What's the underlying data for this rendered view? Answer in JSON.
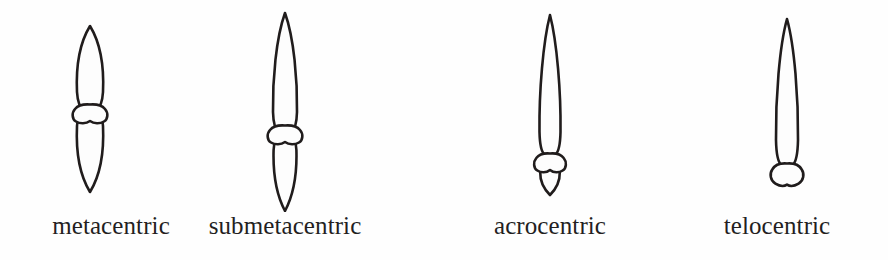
{
  "figure": {
    "background_color": "#fefefe",
    "line_color": "#201c1c",
    "fill_color": "#fdfdfd",
    "text_color": "#241f1f"
  },
  "chromosomes": [
    {
      "id": "metacentric",
      "label": "metacentric",
      "centromere_position": "middle",
      "upper_arm_label": "p arm",
      "lower_arm_label": "q arm",
      "center_x": 90,
      "top_y": 25,
      "bottom_y": 193,
      "centromere_y": 112,
      "upper_arm_length": 87,
      "lower_arm_length": 81,
      "arm_width": 17
    },
    {
      "id": "submetacentric",
      "label": "submetacentric",
      "centromere_position": "off-center toward one end",
      "upper_arm_label": "p arm",
      "lower_arm_label": "q arm",
      "center_x": 285,
      "top_y": 12,
      "bottom_y": 212,
      "centromere_y": 133,
      "upper_arm_length": 121,
      "lower_arm_length": 79,
      "arm_width": 15
    },
    {
      "id": "acrocentric",
      "label": "acrocentric",
      "centromere_position": "near one end",
      "upper_arm_label": "p arm",
      "lower_arm_label": "q arm",
      "center_x": 550,
      "top_y": 14,
      "bottom_y": 196,
      "centromere_y": 161,
      "upper_arm_length": 147,
      "lower_arm_length": 35,
      "arm_width": 14
    },
    {
      "id": "telocentric",
      "label": "telocentric",
      "centromere_position": "terminal",
      "upper_arm_label": "p arm",
      "lower_arm_label": "none",
      "center_x": 787,
      "top_y": 18,
      "bottom_y": 188,
      "centromere_y": 175,
      "upper_arm_length": 157,
      "lower_arm_length": 0,
      "arm_width": 15
    }
  ]
}
